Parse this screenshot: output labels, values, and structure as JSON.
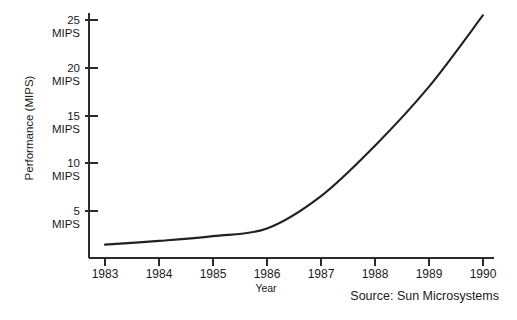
{
  "chart_data": {
    "type": "line",
    "title": "",
    "xlabel": "Year",
    "ylabel": "Performance (MIPS)",
    "x": [
      1983,
      1984,
      1985,
      1986,
      1987,
      1988,
      1989,
      1990
    ],
    "categories": [
      "1983",
      "1984",
      "1985",
      "1986",
      "1987",
      "1988",
      "1989",
      "1990"
    ],
    "series": [
      {
        "name": "Performance",
        "values": [
          1.4,
          1.8,
          2.3,
          3.1,
          6.5,
          11.8,
          18.0,
          25.5
        ]
      }
    ],
    "xlim": [
      1983,
      1990
    ],
    "ylim": [
      0,
      26.5
    ],
    "ytick_values": [
      5,
      10,
      15,
      20,
      25
    ],
    "ytick_labels": [
      "5\nMIPS",
      "10\nMIPS",
      "15\nMIPS",
      "20\nMIPS",
      "25\nMIPS"
    ],
    "ytick_numbers": [
      "5",
      "10",
      "15",
      "20",
      "25"
    ],
    "ytick_unit": "MIPS",
    "grid": false,
    "legend": "none",
    "annotations": [
      {
        "name": "source-note",
        "text": "Source: Sun Microsystems"
      }
    ],
    "line_color": "#212121",
    "axis_color": "#2b2b2b",
    "background_color": "#ffffff"
  },
  "labels": {
    "y_axis_title": "Performance (MIPS)",
    "x_axis_title": "Year",
    "source": "Source: Sun Microsystems",
    "unit": "MIPS"
  },
  "ticks": {
    "y": [
      {
        "number": "25",
        "unit": "MIPS"
      },
      {
        "number": "20",
        "unit": "MIPS"
      },
      {
        "number": "15",
        "unit": "MIPS"
      },
      {
        "number": "10",
        "unit": "MIPS"
      },
      {
        "number": "5",
        "unit": "MIPS"
      }
    ],
    "x": [
      "1983",
      "1984",
      "1985",
      "1986",
      "1987",
      "1988",
      "1989",
      "1990"
    ]
  }
}
